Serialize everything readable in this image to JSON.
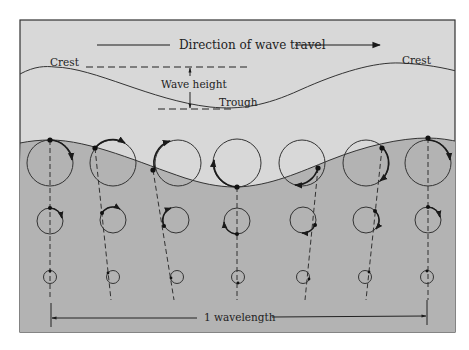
{
  "labels": {
    "direction": "Direction of wave travel",
    "crest_left": "Crest",
    "crest_right": "Crest",
    "wave_height": "Wave height",
    "trough": "Trough",
    "wavelength": "1 wavelength"
  },
  "colors": {
    "sky": "#d8d8d8",
    "water": "#b3b3b3",
    "line": "#2a2a2a",
    "frame": "#333333"
  },
  "columns": [
    {
      "x": 50,
      "dot_angle": -90,
      "arrow": "cw-right"
    },
    {
      "x": 113,
      "dot_angle": -140,
      "arrow": "top"
    },
    {
      "x": 178,
      "dot_angle": 170,
      "arrow": "top-left"
    },
    {
      "x": 237,
      "dot_angle": 90,
      "arrow": "left"
    },
    {
      "x": 302,
      "dot_angle": 30,
      "arrow": "bottom"
    },
    {
      "x": 366,
      "dot_angle": -50,
      "arrow": "right"
    },
    {
      "x": 428,
      "dot_angle": -90,
      "arrow": "cw-right"
    }
  ],
  "orbit_rows": [
    {
      "name": "surface",
      "cy": 163,
      "r": 23
    },
    {
      "name": "middle",
      "cy": 220,
      "r": 13
    },
    {
      "name": "deep",
      "cy": 277,
      "r": 7
    }
  ]
}
